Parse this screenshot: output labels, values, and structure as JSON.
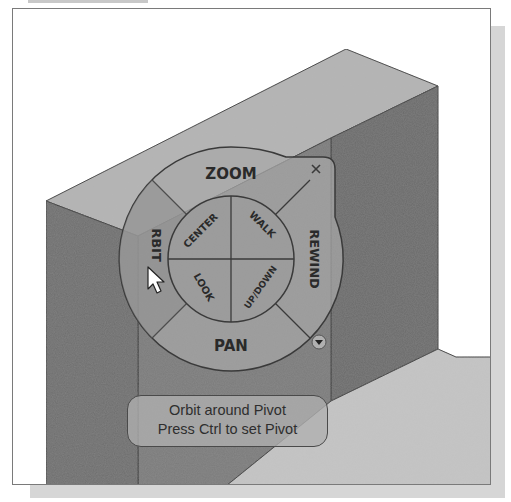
{
  "window": {
    "title": "SteeringWheel navigation in 3D viewport"
  },
  "steering_wheel": {
    "outer_wedges": [
      {
        "id": "zoom",
        "label": "ZOOM"
      },
      {
        "id": "rewind",
        "label": "REWIND"
      },
      {
        "id": "pan",
        "label": "PAN"
      },
      {
        "id": "orbit",
        "label": "ORBIT",
        "visible_text": "RBIT",
        "state": "hover"
      }
    ],
    "inner_wedges": [
      {
        "id": "center",
        "label": "CENTER"
      },
      {
        "id": "walk",
        "label": "WALK"
      },
      {
        "id": "look",
        "label": "LOOK"
      },
      {
        "id": "updown",
        "label": "UP/DOWN"
      }
    ],
    "close_icon": "×",
    "menu_icon": "▾"
  },
  "tooltip": {
    "line1": "Orbit around Pivot",
    "line2": "Press Ctrl to set Pivot"
  },
  "cursor": {
    "type": "arrow-pointer",
    "x": 152,
    "y": 272
  },
  "colors": {
    "frame_border": "#7a7a7a",
    "shadow": "#d6d6d6",
    "box_top_face": "#b4b4b4",
    "box_right_face": "#6a6a6a",
    "box_left_face": "#6e6e6e",
    "box_front_face": "#7a7a7a",
    "floor_face": "#c4c4c4",
    "wheel_fill": "#a8a8a8",
    "wheel_stroke": "#3a3a3a",
    "tooltip_fill": "#afafaf"
  }
}
